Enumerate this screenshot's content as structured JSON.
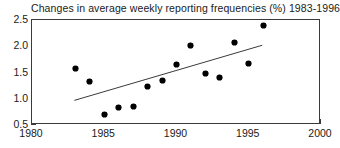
{
  "chart_data": {
    "type": "scatter",
    "title": "Changes in average weekly reporting frequencies (%) 1983-1996",
    "xlabel": "",
    "ylabel": "",
    "xlim": [
      1980,
      2000
    ],
    "ylim": [
      0.5,
      2.5
    ],
    "xticks": [
      1980,
      1985,
      1990,
      1995,
      2000
    ],
    "xtick_labels": [
      "1980",
      "1985",
      "1990",
      "1995",
      "2000"
    ],
    "yticks": [
      0.5,
      1.0,
      1.5,
      2.0,
      2.5
    ],
    "ytick_labels": [
      "0.5",
      "1.0",
      "1.5",
      "2.0",
      "2.5"
    ],
    "grid": false,
    "legend": null,
    "marker_color": "#000000",
    "axis_color": "#3a3a3a",
    "trendline_color": "#3a3a3a",
    "x": [
      1983,
      1984,
      1985,
      1986,
      1987,
      1988,
      1989,
      1990,
      1991,
      1992,
      1993,
      1994,
      1995,
      1996
    ],
    "values": [
      1.58,
      1.32,
      0.7,
      0.84,
      0.85,
      1.23,
      1.34,
      1.65,
      2.01,
      1.48,
      1.41,
      2.08,
      1.68,
      2.4
    ],
    "points": [
      {
        "x": 1983,
        "y": 1.58
      },
      {
        "x": 1984,
        "y": 1.32
      },
      {
        "x": 1985,
        "y": 0.7
      },
      {
        "x": 1986,
        "y": 0.84
      },
      {
        "x": 1987,
        "y": 0.85
      },
      {
        "x": 1988,
        "y": 1.23
      },
      {
        "x": 1989,
        "y": 1.34
      },
      {
        "x": 1990,
        "y": 1.65
      },
      {
        "x": 1991,
        "y": 2.01
      },
      {
        "x": 1992,
        "y": 1.48
      },
      {
        "x": 1993,
        "y": 1.41
      },
      {
        "x": 1994,
        "y": 2.08
      },
      {
        "x": 1995,
        "y": 1.68
      },
      {
        "x": 1996,
        "y": 2.4
      }
    ],
    "trendline": {
      "x_start": 1983,
      "y_start": 0.95,
      "x_end": 1996,
      "y_end": 2.0
    }
  }
}
